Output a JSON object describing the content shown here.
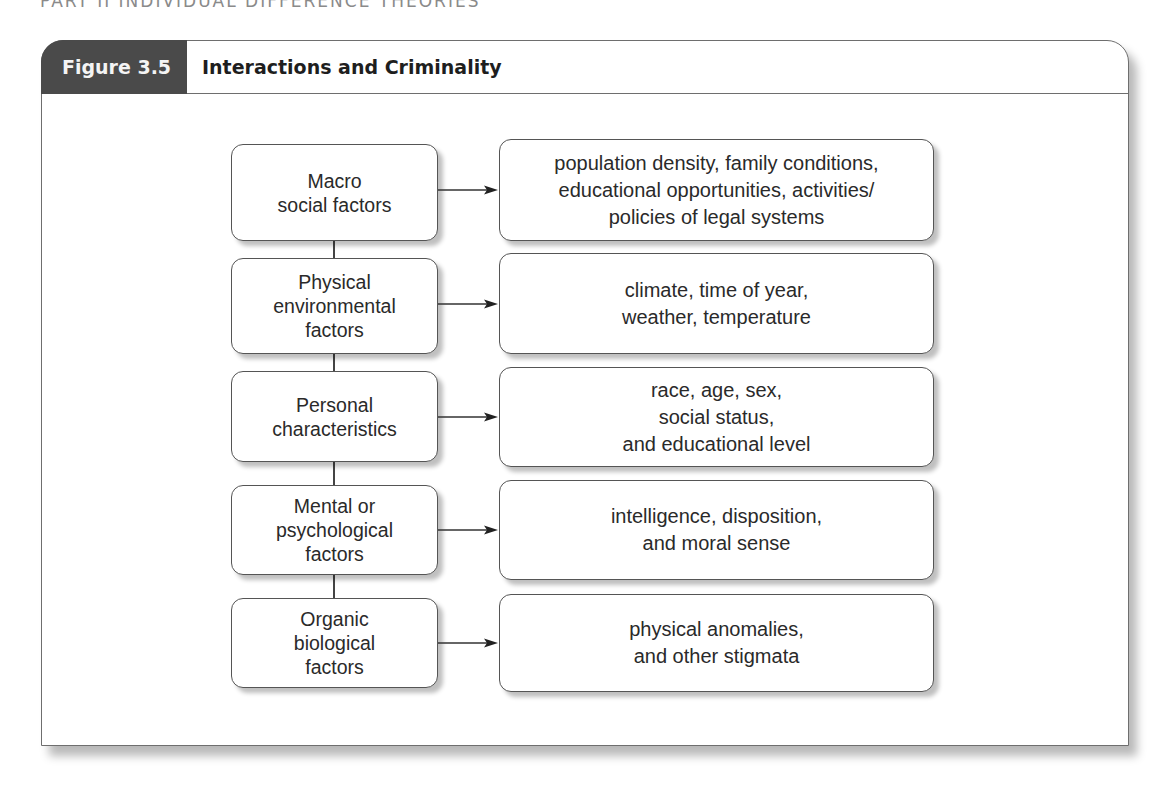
{
  "running_head": "PART II   INDIVIDUAL DIFFERENCE THEORIES",
  "figure": {
    "label": "Figure 3.5",
    "title": "Interactions and Criminality"
  },
  "diagram": {
    "factors": [
      {
        "label": "Macro\nsocial factors",
        "examples": "population density, family conditions,\neducational opportunities, activities/\npolicies of legal systems"
      },
      {
        "label": "Physical\nenvironmental\nfactors",
        "examples": "climate, time of year,\nweather, temperature"
      },
      {
        "label": "Personal\ncharacteristics",
        "examples": "race, age, sex,\nsocial status,\nand educational level"
      },
      {
        "label": "Mental or\npsychological\nfactors",
        "examples": "intelligence, disposition,\nand moral sense"
      },
      {
        "label": "Organic\nbiological\nfactors",
        "examples": "physical anomalies,\nand other stigmata"
      }
    ],
    "colors": {
      "tab_background": "#4a4a4a",
      "tab_text": "#f4f4f4",
      "border": "#555555",
      "text": "#2a2a2a"
    }
  }
}
